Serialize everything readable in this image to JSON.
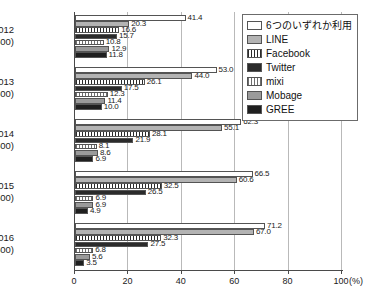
{
  "chart_data": {
    "type": "bar",
    "orientation": "horizontal",
    "title": "",
    "xlabel": "100(%)",
    "ylabel": "",
    "xlim": [
      0,
      100
    ],
    "xticks": [
      0,
      20,
      40,
      60,
      80,
      100
    ],
    "xtick_labels": [
      "0",
      "20",
      "40",
      "60",
      "80",
      "100"
    ],
    "axis_unit": "(%)",
    "grid": true,
    "legend_position": "top-right",
    "categories": [
      "2012",
      "2013",
      "2014",
      "2015",
      "2016"
    ],
    "category_sublabels": [
      "(N=1,500)",
      "(N=1,500)",
      "(N=1,500)",
      "(N=1,500)",
      "(N=1,500)"
    ],
    "series": [
      {
        "name": "6つのいずれか利用",
        "key": "any",
        "color": "#ffffff",
        "values": [
          41.4,
          53.0,
          62.3,
          66.5,
          71.2
        ]
      },
      {
        "name": "LINE",
        "key": "line",
        "color": "#b3b3b3",
        "values": [
          20.3,
          44.0,
          55.1,
          60.6,
          67.0
        ]
      },
      {
        "name": "Facebook",
        "key": "facebook",
        "color": "#2b2b2b",
        "values": [
          16.6,
          26.1,
          28.1,
          32.5,
          32.3
        ]
      },
      {
        "name": "Twitter",
        "key": "twitter",
        "color": "#2b2b2b",
        "values": [
          15.7,
          17.5,
          21.9,
          26.5,
          27.5
        ]
      },
      {
        "name": "mixi",
        "key": "mixi",
        "color": "#6e6e6e",
        "values": [
          10.8,
          12.3,
          8.1,
          6.9,
          6.8
        ]
      },
      {
        "name": "Mobage",
        "key": "mobage",
        "color": "#9a9a9a",
        "values": [
          12.9,
          11.4,
          8.6,
          6.9,
          5.6
        ]
      },
      {
        "name": "GREE",
        "key": "gree",
        "color": "#1f1f1f",
        "values": [
          11.8,
          10.0,
          6.9,
          4.9,
          3.5
        ]
      }
    ],
    "value_labels": {
      "2012": [
        "41.4",
        "20.3",
        "16.6",
        "15.7",
        "10.8",
        "12.9",
        "11.8"
      ],
      "2013": [
        "53.0",
        "44.0",
        "26.1",
        "17.5",
        "12.3",
        "11.4",
        "10.0"
      ],
      "2014": [
        "62.3",
        "55.1",
        "28.1",
        "21.9",
        "8.1",
        "8.6",
        "6.9"
      ],
      "2015": [
        "66.5",
        "60.6",
        "32.5",
        "26.5",
        "6.9",
        "6.9",
        "4.9"
      ],
      "2016": [
        "71.2",
        "67.0",
        "32.3",
        "27.5",
        "6.8",
        "5.6",
        "3.5"
      ]
    }
  }
}
